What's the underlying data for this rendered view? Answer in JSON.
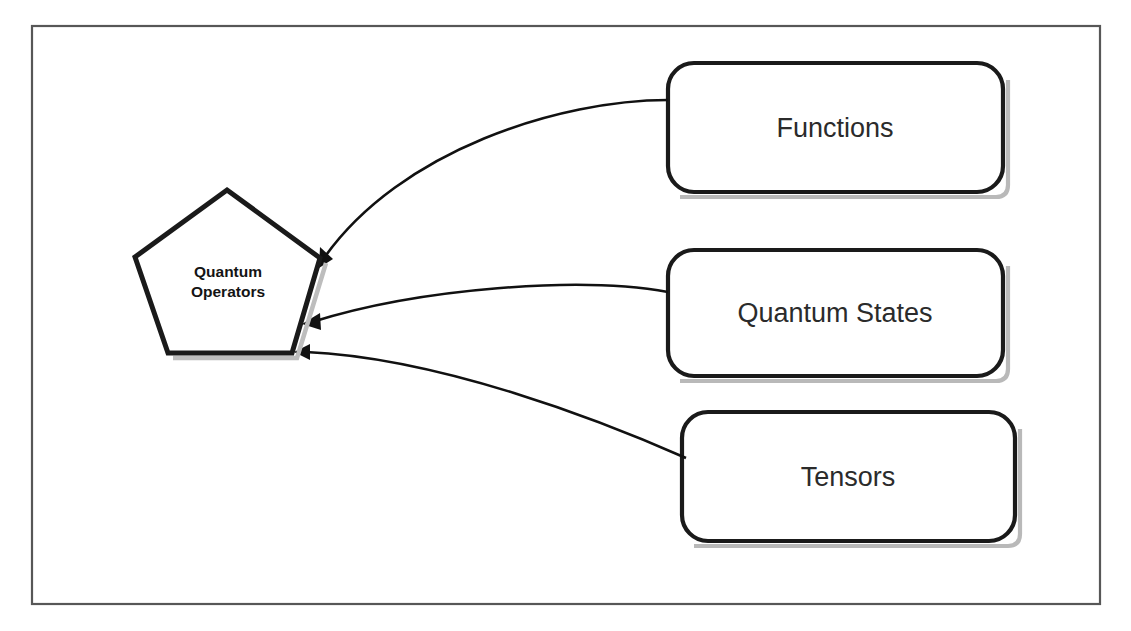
{
  "diagram": {
    "frame": {
      "name": "outer-frame",
      "x": 32,
      "y": 26,
      "width": 1068,
      "height": 578,
      "stroke_color": "#575757"
    },
    "background_color": "#ffffff",
    "center_node": {
      "label_line_1": "Quantum",
      "label_line_2": "Operators",
      "shape": "pentagon",
      "text_color": "#141414",
      "fill_color": "#ffffff",
      "stroke_color": "#1a1a1a",
      "center_x": 227,
      "center_y": 277
    },
    "nodes": [
      {
        "id": "functions",
        "label": "Functions",
        "shape": "rounded-rectangle",
        "x": 668,
        "y": 63,
        "width": 335,
        "height": 129,
        "fill_color": "#ffffff",
        "stroke_color": "#1a1a1a",
        "text_color": "#2b2b2b"
      },
      {
        "id": "quantum-states",
        "label": "Quantum States",
        "shape": "rounded-rectangle",
        "x": 668,
        "y": 250,
        "width": 335,
        "height": 126,
        "fill_color": "#ffffff",
        "stroke_color": "#1a1a1a",
        "text_color": "#2b2b2b"
      },
      {
        "id": "tensors",
        "label": "Tensors",
        "shape": "rounded-rectangle",
        "x": 682,
        "y": 412,
        "width": 333,
        "height": 129,
        "fill_color": "#ffffff",
        "stroke_color": "#1a1a1a",
        "text_color": "#2b2b2b"
      }
    ],
    "edges": [
      {
        "id": "functions-to-operators",
        "from": "functions",
        "to": "center_node",
        "arrow": "single",
        "style": "curved",
        "stroke_color": "#111111"
      },
      {
        "id": "quantum-states-to-operators",
        "from": "quantum-states",
        "to": "center_node",
        "arrow": "single",
        "style": "curved",
        "stroke_color": "#111111"
      },
      {
        "id": "tensors-to-operators",
        "from": "tensors",
        "to": "center_node",
        "arrow": "single",
        "style": "curved",
        "stroke_color": "#111111"
      }
    ]
  }
}
